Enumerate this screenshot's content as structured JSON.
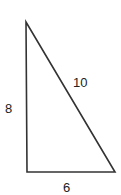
{
  "diagram": {
    "type": "right-triangle",
    "labels": {
      "left_side": "8",
      "hypotenuse": "10",
      "bottom_side": "6"
    },
    "stroke_color": "#333333"
  }
}
